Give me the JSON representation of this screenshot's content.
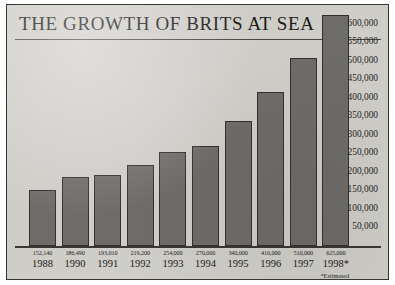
{
  "chart_data": {
    "type": "bar",
    "title": "THE GROWTH OF BRITS AT SEA",
    "xlabel": "",
    "ylabel": "",
    "categories": [
      "1988",
      "1990",
      "1991",
      "1992",
      "1993",
      "1994",
      "1995",
      "1996",
      "1997",
      "1998*"
    ],
    "values": [
      152140,
      186490,
      193010,
      219200,
      254000,
      270000,
      340000,
      416000,
      510000,
      625000
    ],
    "value_labels": [
      "152,140",
      "186,490",
      "193,010",
      "219,200",
      "254,000",
      "270,000",
      "340,000",
      "416,000",
      "510,000",
      "625,000"
    ],
    "ylim": [
      0,
      625000
    ],
    "yticks": [
      600000,
      550000,
      500000,
      450000,
      400000,
      350000,
      300000,
      250000,
      200000,
      150000,
      100000,
      50000
    ],
    "ytick_labels": [
      "600,000",
      "550,000",
      "500,000",
      "450,000",
      "400,000",
      "350,000",
      "300,000",
      "250,000",
      "200,000",
      "150,000",
      "100,000",
      "50,000"
    ],
    "grid": false,
    "legend": null,
    "annotations": [
      "*Estimated"
    ],
    "bar_color": "#6e6c68",
    "bar_edge_color": "#33312e",
    "background_color": "#cfcdc8",
    "frame_color": "#3a3733"
  },
  "footnote": "*Estimated"
}
